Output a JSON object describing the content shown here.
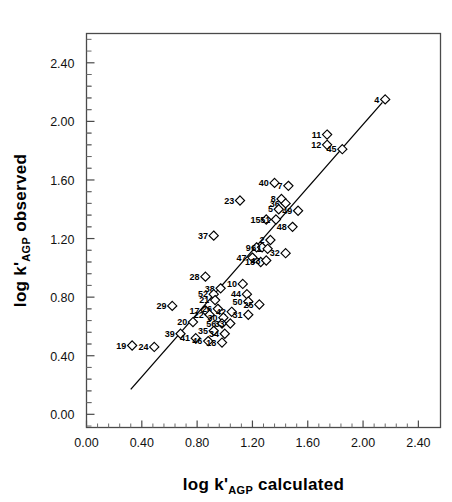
{
  "figure": {
    "background": "#ffffff",
    "ink": "#000000"
  },
  "axis_titles": {
    "x_prefix": "log k'",
    "x_sub": "AGP",
    "x_suffix": " calculated",
    "y_prefix": "log k'",
    "y_sub": "AGP",
    "y_suffix": " observed"
  },
  "chart_data": {
    "type": "scatter",
    "title": "",
    "xlabel": "log k'AGP calculated",
    "ylabel": "log k'AGP observed",
    "xlim": [
      0.0,
      2.56
    ],
    "ylim": [
      -0.09,
      2.6
    ],
    "grid": false,
    "legend": "none",
    "marker": "open-diamond",
    "xticks": [
      "0.00",
      "0.40",
      "0.80",
      "1.20",
      "1.60",
      "2.00",
      "2.40"
    ],
    "xtick_values": [
      0.0,
      0.4,
      0.8,
      1.2,
      1.6,
      2.0,
      2.4
    ],
    "yticks": [
      "0.00",
      "0.40",
      "0.80",
      "1.20",
      "1.60",
      "2.00",
      "2.40"
    ],
    "ytick_values": [
      0.0,
      0.4,
      0.8,
      1.2,
      1.6,
      2.0,
      2.4
    ],
    "minor_ticks_per_interval": 4,
    "fit_line": {
      "x0": 0.32,
      "y0": 0.17,
      "x1": 2.14,
      "y1": 2.13
    },
    "points": [
      {
        "label": "4",
        "x": 2.16,
        "y": 2.15
      },
      {
        "label": "11",
        "x": 1.74,
        "y": 1.91
      },
      {
        "label": "12",
        "x": 1.74,
        "y": 1.84
      },
      {
        "label": "45",
        "x": 1.85,
        "y": 1.81
      },
      {
        "label": "40",
        "x": 1.36,
        "y": 1.58
      },
      {
        "label": "7",
        "x": 1.46,
        "y": 1.56
      },
      {
        "label": "8",
        "x": 1.41,
        "y": 1.47
      },
      {
        "label": "36",
        "x": 1.44,
        "y": 1.44
      },
      {
        "label": "23",
        "x": 1.11,
        "y": 1.46
      },
      {
        "label": "5",
        "x": 1.39,
        "y": 1.4
      },
      {
        "label": "49",
        "x": 1.53,
        "y": 1.39
      },
      {
        "label": "15",
        "x": 1.3,
        "y": 1.33
      },
      {
        "label": "51",
        "x": 1.37,
        "y": 1.33
      },
      {
        "label": "48",
        "x": 1.49,
        "y": 1.28
      },
      {
        "label": "37",
        "x": 0.92,
        "y": 1.22
      },
      {
        "label": "2",
        "x": 1.33,
        "y": 1.19
      },
      {
        "label": "9",
        "x": 1.23,
        "y": 1.14
      },
      {
        "label": "6",
        "x": 1.27,
        "y": 1.14
      },
      {
        "label": "1",
        "x": 1.31,
        "y": 1.13
      },
      {
        "label": "32",
        "x": 1.44,
        "y": 1.1
      },
      {
        "label": "47",
        "x": 1.2,
        "y": 1.07
      },
      {
        "label": "13",
        "x": 1.26,
        "y": 1.04
      },
      {
        "label": "43",
        "x": 1.3,
        "y": 1.05
      },
      {
        "label": "28",
        "x": 0.86,
        "y": 0.94
      },
      {
        "label": "10",
        "x": 1.13,
        "y": 0.89
      },
      {
        "label": "38",
        "x": 0.97,
        "y": 0.86
      },
      {
        "label": "52",
        "x": 0.92,
        "y": 0.82
      },
      {
        "label": "44",
        "x": 1.16,
        "y": 0.82
      },
      {
        "label": "21",
        "x": 0.93,
        "y": 0.78
      },
      {
        "label": "50",
        "x": 1.17,
        "y": 0.77
      },
      {
        "label": "25",
        "x": 1.25,
        "y": 0.75
      },
      {
        "label": "29",
        "x": 0.62,
        "y": 0.74
      },
      {
        "label": "17",
        "x": 0.86,
        "y": 0.71
      },
      {
        "label": "26",
        "x": 0.95,
        "y": 0.72
      },
      {
        "label": "22",
        "x": 0.89,
        "y": 0.68
      },
      {
        "label": "42",
        "x": 1.05,
        "y": 0.7
      },
      {
        "label": "31",
        "x": 1.17,
        "y": 0.68
      },
      {
        "label": "30",
        "x": 0.99,
        "y": 0.66
      },
      {
        "label": "20",
        "x": 0.77,
        "y": 0.63
      },
      {
        "label": "56",
        "x": 0.98,
        "y": 0.62
      },
      {
        "label": "33",
        "x": 1.04,
        "y": 0.62
      },
      {
        "label": "35",
        "x": 0.92,
        "y": 0.57
      },
      {
        "label": "39",
        "x": 0.68,
        "y": 0.55
      },
      {
        "label": "34",
        "x": 1.0,
        "y": 0.55
      },
      {
        "label": "41",
        "x": 0.79,
        "y": 0.52
      },
      {
        "label": "46",
        "x": 0.88,
        "y": 0.5
      },
      {
        "label": "18",
        "x": 0.98,
        "y": 0.49
      },
      {
        "label": "19",
        "x": 0.33,
        "y": 0.47
      },
      {
        "label": "24",
        "x": 0.49,
        "y": 0.46
      }
    ]
  }
}
